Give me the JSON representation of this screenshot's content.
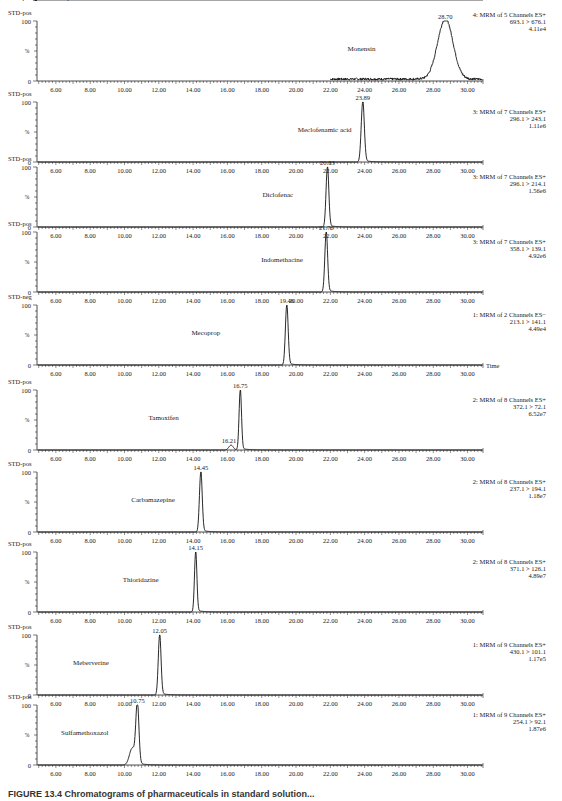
{
  "figure": {
    "caption": "FIGURE 13.4  Chromatograms of pharmaceuticals in standard solution..."
  },
  "axis": {
    "x_label": "Time",
    "x_ticks": [
      "6.00",
      "8.00",
      "10.00",
      "12.00",
      "14.00",
      "16.00",
      "18.00",
      "20.00",
      "22.00",
      "24.00",
      "26.00",
      "28.00",
      "30.00"
    ],
    "y_ticks": [
      "0",
      "100"
    ],
    "y_label": "%"
  },
  "chart_data": {
    "type": "line",
    "xlabel": "Time",
    "ylabel": "%",
    "xlim": [
      4.9,
      30.9
    ],
    "ylim": [
      0,
      100
    ],
    "x_ticks": [
      6,
      8,
      10,
      12,
      14,
      16,
      18,
      20,
      22,
      24,
      26,
      28,
      30
    ],
    "grid": false,
    "panels": [
      {
        "sample": "STD-pos",
        "compound": "Monensin",
        "function": "4: MRM of 5 Channels ES+",
        "transition": "693.1 > 676.1",
        "intensity": "4.11e4",
        "peaks": [
          {
            "rt": 28.7,
            "label": "28.70",
            "height": 100
          }
        ],
        "noisy": true,
        "trace_start": 22.0,
        "peak_width": 0.45,
        "show_time": false
      },
      {
        "sample": "STD-pos",
        "compound": "Meclofenamic acid",
        "function": "3: MRM of 7 Channels ES+",
        "transition": "296.1 > 243.1",
        "intensity": "1.11e6",
        "peaks": [
          {
            "rt": 23.89,
            "label": "23.89",
            "height": 100
          }
        ],
        "peak_width": 0.09,
        "show_time": false
      },
      {
        "sample": "STD-pos",
        "compound": "Diclofenac",
        "function": "3: MRM of 7 Channels ES+",
        "transition": "296.1 > 214.1",
        "intensity": "1.56e6",
        "peaks": [
          {
            "rt": 21.83,
            "label": "21.83",
            "height": 100
          }
        ],
        "peak_width": 0.08,
        "show_time": false
      },
      {
        "sample": "STD-pos",
        "compound": "Indomethacine",
        "function": "3: MRM of 7 Channels ES+",
        "transition": "358.1 > 139.1",
        "intensity": "4.92e6",
        "peaks": [
          {
            "rt": 21.76,
            "label": "21.76",
            "height": 100
          }
        ],
        "peak_width": 0.08,
        "show_time": false
      },
      {
        "sample": "STD-neg",
        "compound": "Mecoprop",
        "function": "1: MRM of 2 Channels ES−",
        "transition": "213.1 > 141.1",
        "intensity": "4.49e4",
        "peaks": [
          {
            "rt": 19.46,
            "label": "19.46",
            "height": 100
          }
        ],
        "peak_width": 0.08,
        "show_time": true
      },
      {
        "sample": "STD-pos",
        "compound": "Tamoxifen",
        "function": "2: MRM of 8 Channels ES+",
        "transition": "372.1 > 72.1",
        "intensity": "6.52e7",
        "peaks": [
          {
            "rt": 16.75,
            "label": "16.75",
            "height": 100
          },
          {
            "rt": 16.21,
            "label": "16.21",
            "height": 8
          }
        ],
        "peak_width": 0.07,
        "show_time": false
      },
      {
        "sample": "STD-pos",
        "compound": "Carbamazepine",
        "function": "2: MRM of 8 Channels ES+",
        "transition": "237.1 > 194.1",
        "intensity": "1.18e7",
        "peaks": [
          {
            "rt": 14.45,
            "label": "14.45",
            "height": 100
          }
        ],
        "peak_width": 0.08,
        "show_time": false
      },
      {
        "sample": "STD-pos",
        "compound": "Thioridazine",
        "function": "2: MRM of 8 Channels ES+",
        "transition": "371.1 > 126.1",
        "intensity": "4.89e7",
        "peaks": [
          {
            "rt": 14.15,
            "label": "14.15",
            "height": 100
          }
        ],
        "peak_width": 0.07,
        "show_time": false
      },
      {
        "sample": "STD-pos",
        "compound": "Meberverine",
        "function": "1: MRM of 9 Channels ES+",
        "transition": "430.1 > 101.1",
        "intensity": "1.17e5",
        "peaks": [
          {
            "rt": 12.05,
            "label": "12.05",
            "height": 100
          }
        ],
        "peak_width": 0.08,
        "show_time": false
      },
      {
        "sample": "STD-pos",
        "compound": "Sulfamethoxazol",
        "function": "1: MRM of 9 Channels ES+",
        "transition": "254.1 > 92.1",
        "intensity": "1.87e6",
        "peaks": [
          {
            "rt": 10.75,
            "label": "10.75",
            "height": 100
          },
          {
            "rt": 10.45,
            "label": "",
            "height": 28
          }
        ],
        "peak_width": 0.09,
        "show_time": false
      },
      {
        "sample": "STD-pos",
        "compound": "Propranolol",
        "function": "1: MRM of 9 Channels ES+",
        "transition": "260.1 > 116.1",
        "intensity": "6.75e6",
        "peaks": [
          {
            "rt": 9.78,
            "label": "9.78",
            "height": 100
          }
        ],
        "peak_width": 0.08,
        "show_time": true
      }
    ]
  },
  "layout": {
    "baselines": [
      81,
      162,
      227,
      292,
      365,
      450,
      532,
      612,
      695,
      765
    ],
    "panel_height": 60
  }
}
